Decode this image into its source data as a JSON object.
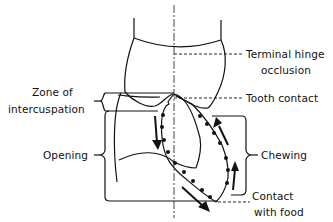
{
  "diagram": {
    "type": "chewing-cycle-tooth-diagram",
    "labels": {
      "terminal_hinge_line1": "Terminal hinge",
      "terminal_hinge_line2": "occlusion",
      "zone_line1": "Zone of",
      "zone_line2": "intercuspation",
      "tooth_contact": "Tooth contact",
      "opening": "Opening",
      "chewing": "Chewing",
      "contact_food_line1": "Contact",
      "contact_food_line2": "with food"
    },
    "colors": {
      "ink": "#111111",
      "background": "#ffffff"
    }
  }
}
